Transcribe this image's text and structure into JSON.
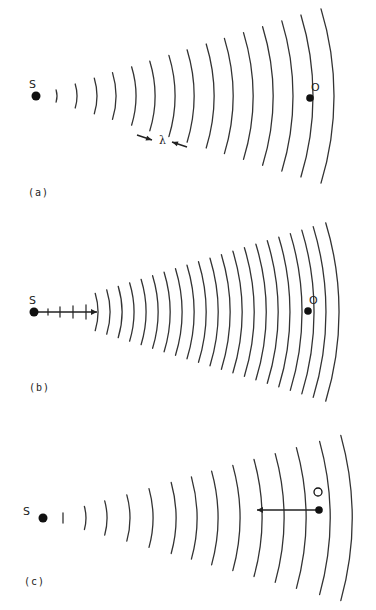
{
  "figure": {
    "panels": [
      {
        "id": "a",
        "label": "(a)",
        "label_pos": [
          28,
          196
        ],
        "source": {
          "label": "S",
          "x": 36,
          "y": 96,
          "label_x": 29,
          "label_y": 88
        },
        "observer": {
          "label": "O",
          "x": 310,
          "y": 98,
          "label_x": 311,
          "label_y": 91
        },
        "wavefronts": {
          "center": [
            36,
            96
          ],
          "radii": [
            21,
            41,
            61,
            80,
            100,
            119,
            139,
            158,
            178,
            197,
            217,
            237,
            257,
            277,
            298
          ],
          "half_angle_deg": 17
        },
        "ticks": [],
        "annotation": {
          "symbol": "λ",
          "x": 159,
          "y": 144,
          "arrow_left": [
            137,
            135,
            152,
            140
          ],
          "arrow_right": [
            187,
            147,
            172,
            142
          ]
        },
        "motion_arrow": null,
        "observer_ghost": null
      },
      {
        "id": "b",
        "label": "(b)",
        "label_pos": [
          29,
          391
        ],
        "source": {
          "label": "S",
          "x": 34,
          "y": 312,
          "label_x": 29,
          "label_y": 304
        },
        "observer": {
          "label": "O",
          "x": 308,
          "y": 311,
          "label_x": 309,
          "label_y": 304
        },
        "wavefronts": {
          "center": [
            34,
            312
          ],
          "radii": [
            64,
            76,
            88,
            100,
            112,
            124,
            136,
            148,
            160,
            172,
            184,
            196,
            208,
            220,
            232,
            244,
            256,
            268,
            280,
            292,
            305
          ],
          "half_angle_deg": 17
        },
        "ticks": [
          {
            "x": 48,
            "y": 312,
            "h": 3
          },
          {
            "x": 60,
            "y": 312,
            "h": 5
          },
          {
            "x": 73,
            "y": 312,
            "h": 6
          },
          {
            "x": 86,
            "y": 312,
            "h": 7
          }
        ],
        "annotation": null,
        "motion_arrow": {
          "x1": 34,
          "y1": 312,
          "x2": 97,
          "y2": 312,
          "direction": "right"
        },
        "observer_ghost": null
      },
      {
        "id": "c",
        "label": "(c)",
        "label_pos": [
          24,
          585
        ],
        "source": {
          "label": "S",
          "x": 43,
          "y": 518,
          "label_x": 23,
          "label_y": 515
        },
        "observer": {
          "label": "",
          "x": 319,
          "y": 510,
          "label_x": 0,
          "label_y": 0
        },
        "wavefronts": {
          "center": [
            43,
            518
          ],
          "radii": [
            43,
            64,
            87,
            110,
            133,
            154,
            175,
            197,
            219,
            241,
            263,
            287,
            309
          ],
          "half_angle_deg": 15.5
        },
        "ticks": [
          {
            "x": 63,
            "y": 518,
            "h": 5
          }
        ],
        "annotation": null,
        "motion_arrow": {
          "x1": 319,
          "y1": 510,
          "x2": 257,
          "y2": 510,
          "direction": "left"
        },
        "observer_ghost": {
          "x": 318,
          "y": 492,
          "r": 4
        }
      }
    ]
  },
  "colors": {
    "ink": "#222222",
    "arc": "#333333",
    "background": "#ffffff"
  }
}
